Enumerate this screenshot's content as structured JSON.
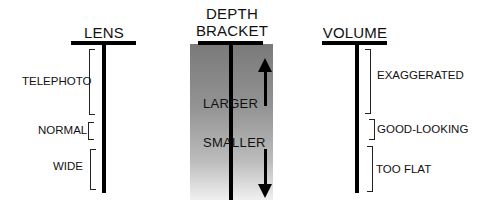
{
  "diagram": {
    "columns": [
      {
        "id": "lens",
        "title": "LENS",
        "brackets": [
          {
            "label": "TELEPHOTO",
            "side": "left"
          },
          {
            "label": "NORMAL",
            "side": "left"
          },
          {
            "label": "WIDE",
            "side": "left"
          }
        ]
      },
      {
        "id": "depth-bracket",
        "title_line1": "DEPTH",
        "title_line2": "BRACKET",
        "arrows": [
          {
            "label": "LARGER",
            "direction": "up"
          },
          {
            "label": "SMALLER",
            "direction": "down"
          }
        ],
        "gradient": {
          "top_color": "#7a7a7a",
          "bottom_color": "#f0f0f0"
        }
      },
      {
        "id": "volume",
        "title": "VOLUME",
        "brackets": [
          {
            "label": "EXAGGERATED",
            "side": "right"
          },
          {
            "label": "GOOD-LOOKING",
            "side": "right"
          },
          {
            "label": "TOO FLAT",
            "side": "right"
          }
        ]
      }
    ]
  }
}
